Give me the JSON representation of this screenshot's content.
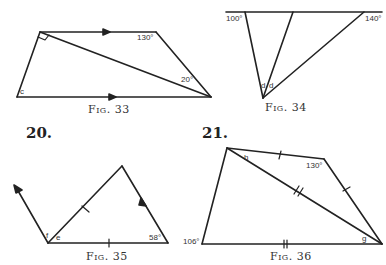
{
  "problems": [
    {
      "number": "20."
    },
    {
      "number": "21."
    }
  ],
  "figures": [
    {
      "id": "fig33",
      "caption": "Fig. 33",
      "labels": {
        "angle_top_right": "130°",
        "angle_diag": "20°",
        "angle_bottom_left": "c"
      }
    },
    {
      "id": "fig34",
      "caption": "Fig. 34",
      "labels": {
        "angle_left": "100°",
        "angle_right": "140°",
        "angle_d1": "d",
        "angle_d2": "d"
      }
    },
    {
      "id": "fig35",
      "caption": "Fig. 35",
      "labels": {
        "angle_f": "f",
        "angle_e": "e",
        "angle_right": "58°"
      }
    },
    {
      "id": "fig36",
      "caption": "Fig. 36",
      "labels": {
        "angle_h": "h",
        "angle_top_right": "130°",
        "angle_left": "106°",
        "angle_g": "g"
      }
    }
  ]
}
